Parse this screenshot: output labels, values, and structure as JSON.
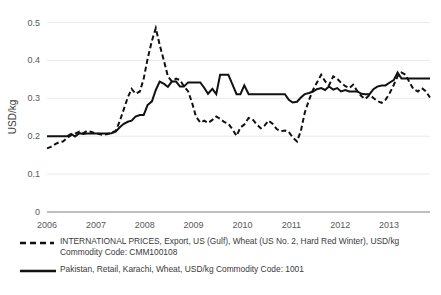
{
  "chart_data": {
    "type": "line",
    "title": "",
    "xlabel": "",
    "ylabel": "USD/kg",
    "ylim": [
      0,
      0.5
    ],
    "xlim": [
      2006.0,
      2013.92
    ],
    "grid": true,
    "legend_position": "bottom",
    "ytick_labels": [
      "0",
      "0.1",
      "0.2",
      "0.3",
      "0.4",
      "0.5"
    ],
    "ytick_values": [
      0,
      0.1,
      0.2,
      0.3,
      0.4,
      0.5
    ],
    "xtick_labels": [
      "2006",
      "2007",
      "2008",
      "2009",
      "2010",
      "2011",
      "2012",
      "2013"
    ],
    "xtick_values": [
      2006,
      2007,
      2008,
      2009,
      2010,
      2011,
      2012,
      2013
    ],
    "series": [
      {
        "name": "INTERNATIONAL PRICES, Export, US (Gulf), Wheat (US No. 2, Hard Red Winter), USD/kg Commodity Code: CMM100108",
        "style": "dashed",
        "color": "#111111",
        "x": [
          2006.0,
          2006.08,
          2006.17,
          2006.25,
          2006.33,
          2006.42,
          2006.5,
          2006.58,
          2006.67,
          2006.75,
          2006.83,
          2006.92,
          2007.0,
          2007.08,
          2007.17,
          2007.25,
          2007.33,
          2007.42,
          2007.5,
          2007.58,
          2007.67,
          2007.75,
          2007.83,
          2007.92,
          2008.0,
          2008.08,
          2008.17,
          2008.25,
          2008.33,
          2008.42,
          2008.5,
          2008.58,
          2008.67,
          2008.75,
          2008.83,
          2008.92,
          2009.0,
          2009.08,
          2009.17,
          2009.25,
          2009.33,
          2009.42,
          2009.5,
          2009.58,
          2009.67,
          2009.75,
          2009.83,
          2009.92,
          2010.0,
          2010.08,
          2010.17,
          2010.25,
          2010.33,
          2010.42,
          2010.5,
          2010.58,
          2010.67,
          2010.75,
          2010.83,
          2010.92,
          2011.0,
          2011.08,
          2011.17,
          2011.25,
          2011.33,
          2011.42,
          2011.5,
          2011.58,
          2011.67,
          2011.75,
          2011.83,
          2011.92,
          2012.0,
          2012.08,
          2012.17,
          2012.25,
          2012.33,
          2012.42,
          2012.5,
          2012.58,
          2012.67,
          2012.75,
          2012.83,
          2012.92,
          2013.0,
          2013.08,
          2013.17,
          2013.25,
          2013.33,
          2013.42,
          2013.5,
          2013.58,
          2013.67,
          2013.75,
          2013.83,
          2013.92
        ],
        "values": [
          0.168,
          0.172,
          0.179,
          0.184,
          0.186,
          0.196,
          0.203,
          0.207,
          0.212,
          0.208,
          0.214,
          0.211,
          0.208,
          0.206,
          0.203,
          0.206,
          0.209,
          0.214,
          0.238,
          0.268,
          0.302,
          0.325,
          0.312,
          0.318,
          0.352,
          0.404,
          0.452,
          0.485,
          0.441,
          0.398,
          0.358,
          0.345,
          0.352,
          0.348,
          0.332,
          0.318,
          0.288,
          0.252,
          0.236,
          0.241,
          0.235,
          0.243,
          0.252,
          0.246,
          0.237,
          0.233,
          0.219,
          0.201,
          0.223,
          0.231,
          0.248,
          0.245,
          0.232,
          0.221,
          0.228,
          0.241,
          0.232,
          0.219,
          0.213,
          0.215,
          0.211,
          0.197,
          0.186,
          0.214,
          0.262,
          0.296,
          0.322,
          0.341,
          0.362,
          0.345,
          0.334,
          0.358,
          0.352,
          0.341,
          0.332,
          0.327,
          0.336,
          0.318,
          0.306,
          0.298,
          0.309,
          0.301,
          0.293,
          0.288,
          0.296,
          0.312,
          0.335,
          0.358,
          0.368,
          0.362,
          0.341,
          0.324,
          0.318,
          0.327,
          0.319,
          0.302
        ]
      },
      {
        "name": "Pakistan, Retail, Karachi, Wheat, USD/kg Commodity Code: 1001",
        "style": "solid",
        "color": "#111111",
        "x": [
          2006.0,
          2006.08,
          2006.17,
          2006.25,
          2006.33,
          2006.42,
          2006.5,
          2006.58,
          2006.67,
          2006.75,
          2006.83,
          2006.92,
          2007.0,
          2007.08,
          2007.17,
          2007.25,
          2007.33,
          2007.42,
          2007.5,
          2007.58,
          2007.67,
          2007.75,
          2007.83,
          2007.92,
          2008.0,
          2008.08,
          2008.17,
          2008.25,
          2008.33,
          2008.42,
          2008.5,
          2008.58,
          2008.67,
          2008.75,
          2008.83,
          2008.92,
          2009.0,
          2009.08,
          2009.17,
          2009.25,
          2009.33,
          2009.42,
          2009.5,
          2009.58,
          2009.67,
          2009.75,
          2009.83,
          2009.92,
          2010.0,
          2010.08,
          2010.17,
          2010.25,
          2010.33,
          2010.42,
          2010.5,
          2010.58,
          2010.67,
          2010.75,
          2010.83,
          2010.92,
          2011.0,
          2011.08,
          2011.17,
          2011.25,
          2011.33,
          2011.42,
          2011.5,
          2011.58,
          2011.67,
          2011.75,
          2011.83,
          2011.92,
          2012.0,
          2012.08,
          2012.17,
          2012.25,
          2012.33,
          2012.42,
          2012.5,
          2012.58,
          2012.67,
          2012.75,
          2012.83,
          2012.92,
          2013.0,
          2013.08,
          2013.17,
          2013.25,
          2013.33,
          2013.42,
          2013.5,
          2013.58,
          2013.67,
          2013.75,
          2013.83,
          2013.92
        ],
        "values": [
          0.2,
          0.2,
          0.2,
          0.2,
          0.2,
          0.2,
          0.206,
          0.199,
          0.208,
          0.206,
          0.207,
          0.207,
          0.207,
          0.207,
          0.207,
          0.207,
          0.208,
          0.212,
          0.223,
          0.232,
          0.238,
          0.241,
          0.252,
          0.256,
          0.256,
          0.282,
          0.292,
          0.322,
          0.344,
          0.338,
          0.33,
          0.344,
          0.344,
          0.331,
          0.331,
          0.342,
          0.342,
          0.342,
          0.342,
          0.328,
          0.312,
          0.325,
          0.311,
          0.362,
          0.362,
          0.362,
          0.338,
          0.311,
          0.311,
          0.334,
          0.311,
          0.311,
          0.311,
          0.311,
          0.311,
          0.311,
          0.311,
          0.311,
          0.311,
          0.311,
          0.296,
          0.289,
          0.291,
          0.302,
          0.311,
          0.314,
          0.318,
          0.324,
          0.327,
          0.322,
          0.331,
          0.323,
          0.327,
          0.318,
          0.322,
          0.318,
          0.318,
          0.318,
          0.312,
          0.311,
          0.311,
          0.324,
          0.331,
          0.334,
          0.334,
          0.341,
          0.348,
          0.368,
          0.352,
          0.352,
          0.352,
          0.352,
          0.352,
          0.352,
          0.352,
          0.352
        ]
      }
    ]
  },
  "axes": {
    "y_title": "USD/kg",
    "y_ticks": [
      "0.5",
      "0.4",
      "0.3",
      "0.2",
      "0.1",
      "0"
    ],
    "x_ticks": [
      "2006",
      "2007",
      "2008",
      "2009",
      "2010",
      "2011",
      "2012",
      "2013"
    ]
  },
  "legend": {
    "items": [
      {
        "marker": "dashed-line-marker",
        "line1": "INTERNATIONAL PRICES, Export, US (Gulf), Wheat (US No. 2, Hard Red Winter), USD/kg",
        "line2": "Commodity Code: CMM100108"
      },
      {
        "marker": "solid-line-marker",
        "line1": "Pakistan, Retail, Karachi, Wheat, USD/kg Commodity Code: 1001",
        "line2": ""
      }
    ]
  }
}
